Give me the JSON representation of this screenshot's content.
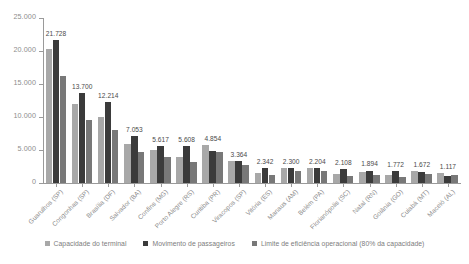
{
  "chart_data": {
    "type": "bar",
    "title": "",
    "xlabel": "",
    "ylabel": "",
    "ylim": [
      0,
      25000
    ],
    "grid": false,
    "legend_position": "bottom",
    "y_ticks": [
      "0",
      "5.000",
      "10.000",
      "15.000",
      "20.000",
      "25.000"
    ],
    "y_tick_values": [
      0,
      5000,
      10000,
      15000,
      20000,
      25000
    ],
    "categories": [
      "Guarulhos (SP)",
      "Congonhas (SP)",
      "Brasília (DF)",
      "Salvador (BA)",
      "Confins (MG)",
      "Porto Alegre (RS)",
      "Curitiba (PR)",
      "Viracopos (SP)",
      "Vitória (ES)",
      "Manaus (AM)",
      "Belém (PA)",
      "Florianópolis (SC)",
      "Natal (RN)",
      "Goiânia (GO)",
      "Cuiabá (MT)",
      "Maceió (AL)"
    ],
    "series": [
      {
        "name": "Capacidade do terminal",
        "color": "#a8a8a8",
        "values": [
          20300,
          11900,
          10000,
          5850,
          4950,
          3950,
          5800,
          3350,
          1450,
          2200,
          2300,
          1400,
          1600,
          1150,
          1750,
          1500
        ]
      },
      {
        "name": "Movimento de passageiros",
        "color": "#3b3b3b",
        "values": [
          21728,
          13700,
          12214,
          7053,
          5617,
          5608,
          4854,
          3364,
          2342,
          2300,
          2204,
          2108,
          1894,
          1772,
          1672,
          1117
        ]
      },
      {
        "name": "Limite de eficiência operacional (80% da capacidade)",
        "color": "#787878",
        "values": [
          16240,
          9520,
          8000,
          4680,
          3960,
          3160,
          4640,
          2680,
          1160,
          1760,
          1840,
          1120,
          1280,
          920,
          1400,
          1200
        ]
      }
    ],
    "value_labels": [
      "21.728",
      "13.700",
      "12.214",
      "7.053",
      "5.617",
      "5.608",
      "4.854",
      "3.364",
      "2.342",
      "2.300",
      "2.204",
      "2.108",
      "1.894",
      "1.772",
      "1.672",
      "1.117"
    ]
  }
}
